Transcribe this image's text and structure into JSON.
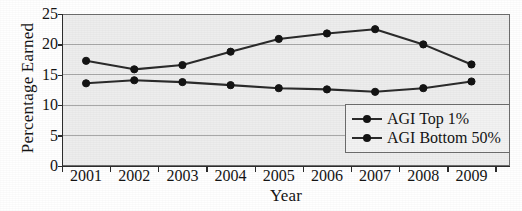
{
  "chart_data": {
    "type": "line",
    "title": "",
    "xlabel": "Year",
    "ylabel": "Percentage Earned",
    "categories": [
      "2001",
      "2002",
      "2003",
      "2004",
      "2005",
      "2006",
      "2007",
      "2008",
      "2009"
    ],
    "x": [
      2001,
      2002,
      2003,
      2004,
      2005,
      2006,
      2007,
      2008,
      2009
    ],
    "series": [
      {
        "name": "AGI Top 1%",
        "values": [
          17.3,
          15.9,
          16.6,
          18.8,
          20.9,
          21.8,
          22.5,
          20.0,
          16.7
        ],
        "color": "#2b2b2b",
        "marker": "circle"
      },
      {
        "name": "AGI Bottom 50%",
        "values": [
          13.6,
          14.1,
          13.8,
          13.3,
          12.8,
          12.6,
          12.2,
          12.8,
          13.9
        ],
        "color": "#2b2b2b",
        "marker": "circle"
      }
    ],
    "ylim": [
      0,
      25
    ],
    "yticks": [
      0,
      5,
      10,
      15,
      20,
      25
    ],
    "ytick_labels": [
      "0",
      "5",
      "10",
      "15",
      "20",
      "25"
    ],
    "xlim": [
      2000.5,
      2009.8
    ],
    "grid": "horizontal",
    "legend_position": "lower-right",
    "plot_background": "#ededed",
    "gridline_color": "#a8a8a8"
  },
  "legend": {
    "entries": [
      {
        "label": "AGI Top 1%"
      },
      {
        "label": "AGI Bottom 50%"
      }
    ]
  }
}
